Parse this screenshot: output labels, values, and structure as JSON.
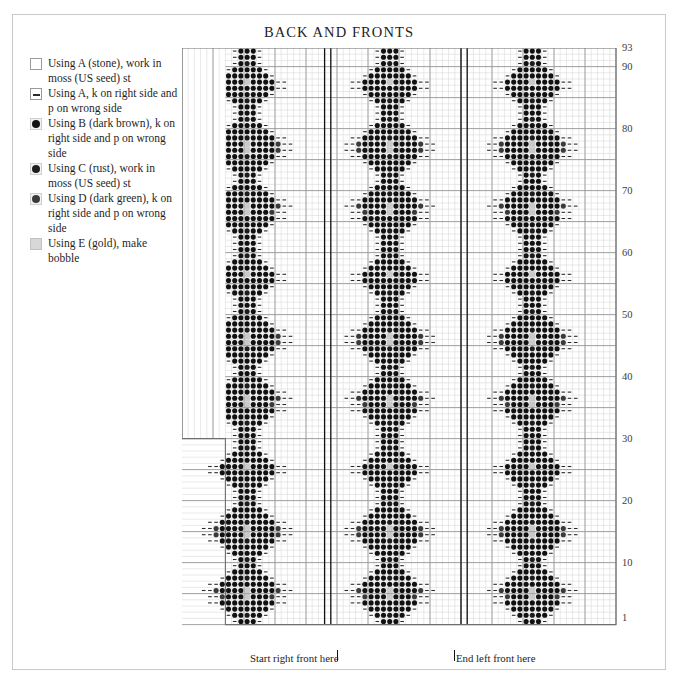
{
  "title": "BACK AND FRONTS",
  "legend": {
    "items": [
      {
        "symbol": "blank-square",
        "color": "#ffffff",
        "label": "Using A (stone), work in moss (US seed) st"
      },
      {
        "symbol": "dash-square",
        "color": "#ffffff",
        "label": "Using A, k on right side and p on wrong side"
      },
      {
        "symbol": "dark-brown-dot",
        "color": "#111111",
        "label": "Using B (dark brown), k on right side and p on wrong side"
      },
      {
        "symbol": "rust-dot",
        "color": "#1d1d1d",
        "label": "Using C (rust), work in moss (US seed) st"
      },
      {
        "symbol": "dark-green-dot",
        "color": "#3a3a3a",
        "label": "Using D (dark green), k on right side and p on wrong side"
      },
      {
        "symbol": "gold-square",
        "color": "#d8d8d8",
        "label": "Using E (gold), make bobble"
      }
    ]
  },
  "captions": {
    "start_right_front": "Start right front here",
    "end_left_front": "End left front here"
  },
  "chart_data": {
    "type": "heatmap",
    "title": "BACK AND FRONTS",
    "xlabel": "",
    "ylabel": "",
    "grid": true,
    "legend_position": "left",
    "columns": 70,
    "rows": 93,
    "row_tick_labels": [
      "1",
      "10",
      "20",
      "30",
      "40",
      "50",
      "60",
      "70",
      "80",
      "90",
      "93"
    ],
    "row_ticks": [
      1,
      10,
      20,
      30,
      40,
      50,
      60,
      70,
      80,
      90,
      93
    ],
    "col_start_full_width": 7,
    "row_widen_at": 30,
    "cell_px": 6.2,
    "heavy_line_every": 5,
    "repeat_marker_columns": [
      23,
      24,
      45,
      46
    ],
    "motif_centers": [
      10,
      33,
      56
    ],
    "motif_period_rows": 31,
    "symbol_codes": {
      "0": "A-moss-blank",
      "1": "A-dash",
      "2": "B-dark-brown",
      "3": "C-rust",
      "4": "D-dark-green",
      "5": "E-gold-bobble"
    },
    "palette": {
      "A-moss-blank": "#ffffff",
      "A-dash": "#2a2a2a",
      "B-dark-brown": "#111111",
      "C-rust": "#1d1d1d",
      "D-dark-green": "#3a3a3a",
      "E-gold-bobble": "#c9c9c9"
    },
    "grid_colors": {
      "light": "#d2d2d2",
      "heavy": "#9a9a9a",
      "marker": "#111111",
      "border": "#6f6f6f"
    }
  }
}
